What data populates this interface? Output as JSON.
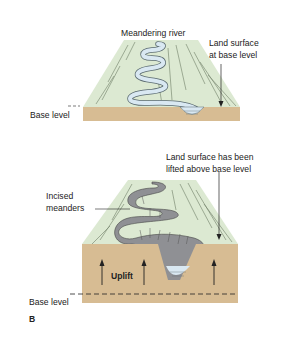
{
  "colors": {
    "land_top": "#dce9d2",
    "land_hatch": "#6f7d66",
    "base_block": "#d7bc93",
    "river_water": "#d9e8f2",
    "canyon_rock": "#8f9094",
    "text": "#222222"
  },
  "panel_a": {
    "river_label": "Meandering river",
    "surface_label_line1": "Land surface",
    "surface_label_line2": "at base level",
    "base_level_label": "Base level"
  },
  "panel_b": {
    "surface_label_line1": "Land surface has been",
    "surface_label_line2": "lifted above base level",
    "incised_label_line1": "Incised",
    "incised_label_line2": "meanders",
    "uplift_label": "Uplift",
    "base_level_label": "Base level",
    "panel_letter": "B"
  }
}
